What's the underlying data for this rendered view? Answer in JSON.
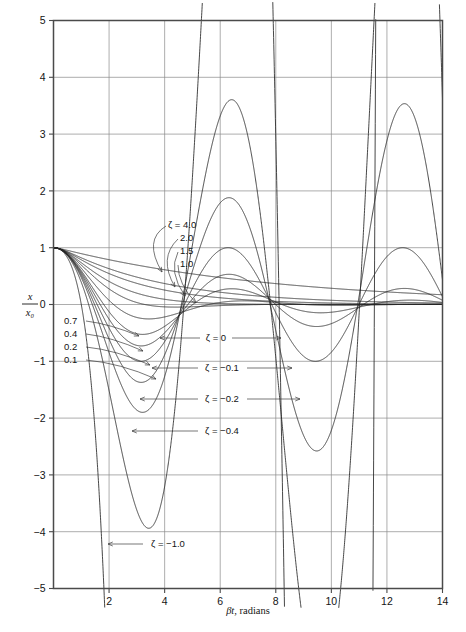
{
  "chart_data": {
    "type": "line",
    "title": "",
    "xlabel": "βt, radians",
    "ylabel": "x/x₀",
    "ylabel_num": "x",
    "ylabel_den": "x₀",
    "xlim": [
      0,
      14
    ],
    "ylim": [
      -5,
      5
    ],
    "grid": true,
    "legend_position": "inline-annotations",
    "xticks": [
      0,
      2,
      4,
      6,
      8,
      10,
      12,
      14
    ],
    "xticklabels": [
      "",
      "2",
      "4",
      "6",
      "8",
      "10",
      "12",
      "14"
    ],
    "yticks": [
      -5,
      -4,
      -3,
      -2,
      -1,
      0,
      1,
      2,
      3,
      4,
      5
    ],
    "yticklabels": [
      "−5",
      "−4",
      "−3",
      "−2",
      "−1",
      "0",
      "1",
      "2",
      "3",
      "4",
      "5"
    ],
    "x_gridlines": [
      2,
      4,
      6,
      8,
      10,
      12
    ],
    "y_gridlines": [
      -4,
      -3,
      -2,
      -1,
      0,
      1,
      2,
      3,
      4
    ],
    "series": [
      {
        "name": "ζ = 4.0",
        "zeta": 4.0,
        "label": "4.0"
      },
      {
        "name": "ζ = 2.0",
        "zeta": 2.0,
        "label": "2.0"
      },
      {
        "name": "ζ = 1.5",
        "zeta": 1.5,
        "label": "1.5"
      },
      {
        "name": "ζ = 1.0",
        "zeta": 1.0,
        "label": "1.0"
      },
      {
        "name": "ζ = 0.7",
        "zeta": 0.7,
        "label": "0.7"
      },
      {
        "name": "ζ = 0.4",
        "zeta": 0.4,
        "label": "0.4"
      },
      {
        "name": "ζ = 0.2",
        "zeta": 0.2,
        "label": "0.2"
      },
      {
        "name": "ζ = 0.1",
        "zeta": 0.1,
        "label": "0.1"
      },
      {
        "name": "ζ = 0",
        "zeta": 0.0,
        "label": "ζ = 0"
      },
      {
        "name": "ζ = −0.1",
        "zeta": -0.1,
        "label": "ζ = −0.1"
      },
      {
        "name": "ζ = −0.2",
        "zeta": -0.2,
        "label": "ζ = −0.2"
      },
      {
        "name": "ζ = −0.4",
        "zeta": -0.4,
        "label": "ζ = −0.4"
      },
      {
        "name": "ζ = −1.0",
        "zeta": -1.0,
        "label": "ζ = −1.0"
      }
    ]
  },
  "annotations": {
    "zeta_eq_4": "ζ = 4.0",
    "zeta_2": "2.0",
    "zeta_15": "1.5",
    "zeta_10": "1.0",
    "zeta_07": "0.7",
    "zeta_04": "0.4",
    "zeta_02": "0.2",
    "zeta_01": "0.1",
    "zeta_0": "ζ = 0",
    "zeta_m01": "ζ = −0.1",
    "zeta_m02": "ζ = −0.2",
    "zeta_m04": "ζ = −0.4",
    "zeta_m10": "ζ = −1.0"
  },
  "axes": {
    "x_title": "βt, radians",
    "y_num": "x",
    "y_den": "x₀",
    "x_labels": [
      "2",
      "4",
      "6",
      "8",
      "10",
      "12",
      "14"
    ],
    "y_labels": [
      "5",
      "4",
      "3",
      "2",
      "1",
      "0",
      "−1",
      "−2",
      "−3",
      "−4",
      "−5"
    ]
  },
  "colors": {
    "curve": "#262626",
    "grid": "#8a8a8a",
    "frame": "#4a4a4a",
    "text": "#141414",
    "background": "#ffffff"
  }
}
